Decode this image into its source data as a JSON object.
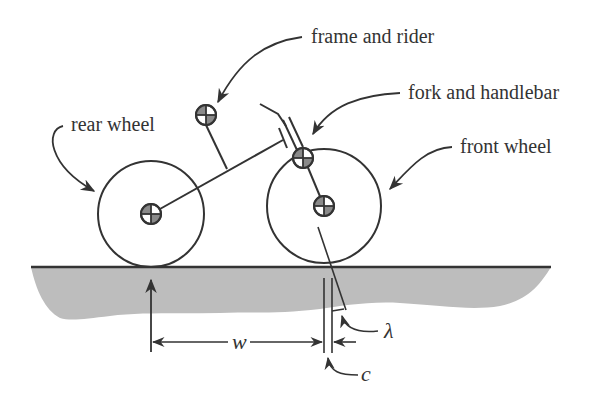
{
  "figure": {
    "type": "bicycle model schematic",
    "colors": {
      "ink": "#333333",
      "ground_fill": "#bdbdbd",
      "com_shade": "#8a8a8a",
      "background": "#ffffff"
    }
  },
  "labels": {
    "frame_and_rider": "frame and rider",
    "fork_and_handlebar": "fork and handlebar",
    "rear_wheel": "rear wheel",
    "front_wheel": "front wheel"
  },
  "dimensions": {
    "wheelbase": "w",
    "steer_axis_tilt": "λ",
    "trail": "c"
  },
  "components": [
    {
      "name": "rear wheel",
      "marker": "center-of-mass-icon"
    },
    {
      "name": "frame and rider",
      "marker": "center-of-mass-icon"
    },
    {
      "name": "fork and handlebar",
      "marker": "center-of-mass-icon"
    },
    {
      "name": "front wheel",
      "marker": "center-of-mass-icon"
    }
  ]
}
